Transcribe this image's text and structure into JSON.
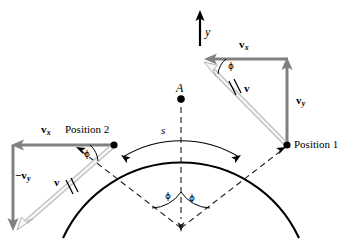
{
  "figure": {
    "type": "physics-vector-diagram",
    "width": 358,
    "height": 240,
    "background_color": "#ffffff"
  },
  "colors": {
    "stroke_black": "#000000",
    "vector_gray": "#808080",
    "vector_outline_fill": "#f2f2f2",
    "vector_outline_stroke": "#b3b3b3",
    "dashed": "#1a1a1a"
  },
  "labels": {
    "y_axis": "y",
    "point_a": "A",
    "arc_length": "s",
    "position_1": "Position 1",
    "position_2": "Position 2",
    "v_right": "v",
    "v_left": "v",
    "vx_right": "v",
    "vx_right_sub": "x",
    "vx_left": "v",
    "vx_left_sub": "x",
    "vy_right": "v",
    "vy_right_sub": "y",
    "vy_left": "−v",
    "vy_left_sub": "y",
    "phi_right_vector": "ϕ",
    "phi_left_vector": "ϕ",
    "phi_center_left": "ϕ",
    "phi_center_right": "ϕ"
  },
  "geometry": {
    "circle_center": {
      "x": 181,
      "y": 228
    },
    "circle_radius": 130,
    "apex_point_a": {
      "x": 181,
      "y": 99
    },
    "position_1_point": {
      "x": 287,
      "y": 145
    },
    "position_2_point": {
      "x": 114,
      "y": 145
    },
    "inner_arc_radius": 112,
    "phi_angle_degrees": 35,
    "y_axis_arrow": {
      "x": 200,
      "y_top": 12,
      "y_bottom": 46
    },
    "right_vx_arrow": {
      "from_x": 287,
      "to_x": 205,
      "y": 59
    },
    "right_vy_arrow": {
      "x": 287,
      "from_y": 145,
      "to_y": 59
    },
    "right_v_arrow": {
      "from_x": 287,
      "from_y": 145,
      "to_x": 203,
      "to_y": 62
    },
    "left_vx_arrow": {
      "from_x": 114,
      "to_x": 12,
      "y": 145
    },
    "left_vy_arrow": {
      "x": 12,
      "from_y": 145,
      "to_y": 228
    },
    "left_v_arrow": {
      "from_x": 114,
      "from_y": 145,
      "to_x": 16,
      "to_y": 228
    }
  }
}
